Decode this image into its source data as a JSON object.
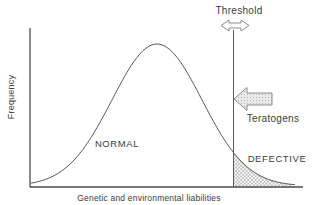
{
  "figure": {
    "y_axis_label": "Frequency",
    "x_axis_label": "Genetic and environmental liabilities",
    "threshold_label": "Threshold",
    "teratogens_label": "Teratogens",
    "normal_label": "NORMAL",
    "defective_label": "DEFECTIVE"
  },
  "colors": {
    "background": "#ffffff",
    "ink_text": "#3d3d3d",
    "axis_line": "#4a4a4a",
    "curve_line": "#5a5a5a",
    "arrow_outline": "#8c8c8c",
    "arrow_fill": "#e9e9e9",
    "hatch": "#8f8f8f"
  }
}
